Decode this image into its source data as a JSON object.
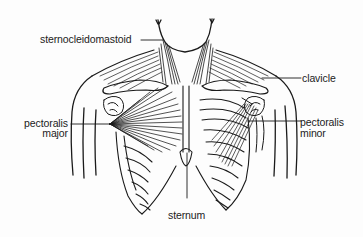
{
  "diagram": {
    "colors": {
      "line": "#1a1a1a",
      "text": "#222222",
      "background": "#fdfdfd"
    },
    "labels": {
      "sternocleidomastoid": "sternocleidomastoid",
      "clavicle": "clavicle",
      "pectoralis_major_line1": "pectoralis",
      "pectoralis_major_line2": "major",
      "pectoralis_minor_line1": "pectoralis",
      "pectoralis_minor_line2": "minor",
      "sternum": "sternum"
    }
  }
}
